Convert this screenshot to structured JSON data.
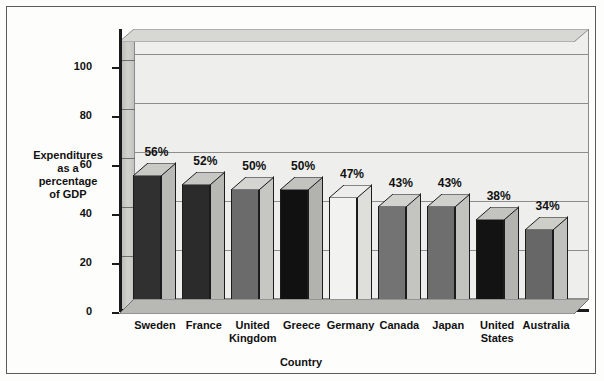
{
  "chart_data": {
    "type": "bar",
    "title": "",
    "xlabel": "Country",
    "ylabel": "Expenditures\nas a\npercentage\nof GDP",
    "ylim": [
      0,
      110
    ],
    "yticks": [
      0,
      20,
      40,
      60,
      80,
      100
    ],
    "grid": true,
    "legend": "none",
    "value_suffix": "%",
    "categories": [
      "Sweden",
      "France",
      "United\nKingdom",
      "Greece",
      "Germany",
      "Canada",
      "Japan",
      "United\nStates",
      "Australia"
    ],
    "values": [
      56,
      52,
      50,
      50,
      47,
      43,
      43,
      38,
      34
    ],
    "value_labels": [
      "56%",
      "52%",
      "50%",
      "50%",
      "47%",
      "43%",
      "43%",
      "38%",
      "34%"
    ],
    "bar_colors": [
      "#303030",
      "#2b2b2b",
      "#6b6b6b",
      "#111111",
      "#f2f2f0",
      "#737373",
      "#6e6e6e",
      "#131313",
      "#676767"
    ],
    "bar_side_colors": [
      "#b9b9b5",
      "#b7b7b3",
      "#c6c6c2",
      "#b2b2ae",
      "#dededa",
      "#c4c4c0",
      "#c2c2be",
      "#b3b3af",
      "#c0c0bc"
    ],
    "bar_top_colors": [
      "#c9c9c5",
      "#c7c7c3",
      "#d4d4d0",
      "#c2c2be",
      "#ededeb",
      "#d2d2ce",
      "#d0d0cc",
      "#c3c3bf",
      "#cecec9"
    ]
  },
  "colors": {
    "background": "#fdfdfc",
    "frame_border": "#5a5a5a",
    "axis": "#1a1a1a",
    "gridline": "#8d8d8d",
    "wall_back": "#eeeeec",
    "wall_side": "#c9c9c5",
    "text": "#111111"
  }
}
